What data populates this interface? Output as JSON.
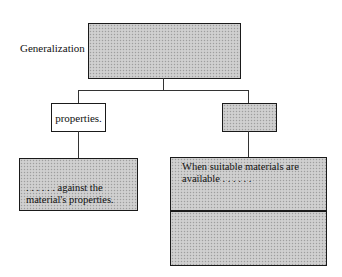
{
  "diagram": {
    "root": {
      "side_label": "Generalization",
      "text": ""
    },
    "children": [
      {
        "label": "properties.",
        "shaded": false,
        "detail": {
          "lines": [
            ". . . . . . against the",
            "material's properties."
          ],
          "shaded": true
        }
      },
      {
        "label": "",
        "shaded": true,
        "detail": {
          "lines": [
            "When suitable materials are",
            "available . . . . . ."
          ],
          "shaded": true,
          "sections": 2
        }
      }
    ]
  }
}
